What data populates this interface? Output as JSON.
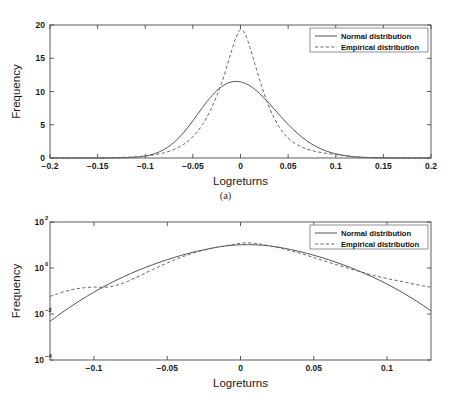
{
  "figure": {
    "caption_a": "(a)",
    "caption_b": "(b)"
  },
  "chart_data": [
    {
      "type": "line",
      "panel": "a",
      "title": "",
      "xlabel": "Logreturns",
      "ylabel": "Frequency",
      "xlim": [
        -0.2,
        0.2
      ],
      "ylim": [
        0,
        20
      ],
      "yscale": "linear",
      "xticks": [
        -0.2,
        -0.15,
        -0.1,
        -0.05,
        0,
        0.05,
        0.1,
        0.15,
        0.2
      ],
      "xticklabels": [
        "-0.2",
        "-0.15",
        "-0.1",
        "-0.05",
        "0",
        "0.05",
        "0.1",
        "0.15",
        "0.2"
      ],
      "yticks": [
        0,
        5,
        10,
        15,
        20
      ],
      "yticklabels": [
        "0",
        "5",
        "10",
        "15",
        "20"
      ],
      "grid": false,
      "legend_position": "upper right",
      "series": [
        {
          "name": "Normal distribution",
          "style": "solid",
          "color": "#555555",
          "x": [
            -0.2,
            -0.19,
            -0.18,
            -0.17,
            -0.16,
            -0.15,
            -0.14,
            -0.13,
            -0.12,
            -0.11,
            -0.1,
            -0.095,
            -0.09,
            -0.085,
            -0.08,
            -0.075,
            -0.07,
            -0.065,
            -0.06,
            -0.055,
            -0.05,
            -0.045,
            -0.04,
            -0.035,
            -0.03,
            -0.025,
            -0.02,
            -0.015,
            -0.01,
            -0.005,
            0,
            0.005,
            0.01,
            0.015,
            0.02,
            0.025,
            0.03,
            0.035,
            0.04,
            0.045,
            0.05,
            0.055,
            0.06,
            0.065,
            0.07,
            0.075,
            0.08,
            0.085,
            0.09,
            0.095,
            0.1,
            0.11,
            0.12,
            0.13,
            0.14,
            0.15,
            0.16,
            0.17,
            0.18,
            0.19,
            0.2
          ],
          "y": [
            0.0,
            0.0,
            0.0,
            0.0,
            0.0,
            0.0,
            0.01,
            0.02,
            0.05,
            0.13,
            0.3,
            0.45,
            0.66,
            0.94,
            1.3,
            1.76,
            2.32,
            3.0,
            3.78,
            4.65,
            5.6,
            6.58,
            7.57,
            8.51,
            9.37,
            10.11,
            10.71,
            11.15,
            11.42,
            11.52,
            11.45,
            11.22,
            10.84,
            10.33,
            9.71,
            9.0,
            8.23,
            7.43,
            6.62,
            5.82,
            5.06,
            4.34,
            3.68,
            3.08,
            2.55,
            2.08,
            1.68,
            1.34,
            1.05,
            0.82,
            0.63,
            0.35,
            0.18,
            0.09,
            0.04,
            0.02,
            0.01,
            0.0,
            0.0,
            0.0,
            0.0
          ]
        },
        {
          "name": "Empirical distribution",
          "style": "dashed",
          "color": "#666666",
          "x": [
            -0.2,
            -0.19,
            -0.18,
            -0.17,
            -0.16,
            -0.15,
            -0.14,
            -0.13,
            -0.12,
            -0.115,
            -0.11,
            -0.105,
            -0.1,
            -0.095,
            -0.09,
            -0.085,
            -0.08,
            -0.075,
            -0.07,
            -0.065,
            -0.06,
            -0.055,
            -0.05,
            -0.045,
            -0.04,
            -0.035,
            -0.03,
            -0.025,
            -0.02,
            -0.015,
            -0.01,
            -0.005,
            0,
            0.005,
            0.01,
            0.015,
            0.02,
            0.025,
            0.03,
            0.035,
            0.04,
            0.045,
            0.05,
            0.055,
            0.06,
            0.065,
            0.07,
            0.075,
            0.08,
            0.085,
            0.09,
            0.095,
            0.1,
            0.105,
            0.11,
            0.115,
            0.12,
            0.13,
            0.14,
            0.15,
            0.16,
            0.17,
            0.18,
            0.19,
            0.2
          ],
          "y": [
            0.0,
            0.0,
            0.0,
            0.0,
            0.01,
            0.02,
            0.04,
            0.07,
            0.11,
            0.14,
            0.18,
            0.23,
            0.3,
            0.38,
            0.49,
            0.62,
            0.79,
            1.0,
            1.27,
            1.6,
            2.02,
            2.55,
            3.2,
            4.0,
            5.0,
            6.2,
            7.65,
            9.3,
            11.2,
            13.4,
            15.8,
            18.0,
            19.3,
            18.6,
            16.6,
            14.2,
            11.8,
            9.6,
            7.7,
            6.1,
            4.8,
            3.8,
            3.0,
            2.4,
            1.95,
            1.6,
            1.32,
            1.12,
            0.95,
            0.82,
            0.7,
            0.6,
            0.5,
            0.41,
            0.33,
            0.25,
            0.18,
            0.09,
            0.04,
            0.02,
            0.01,
            0.0,
            0.0,
            0.0,
            0.0
          ]
        }
      ]
    },
    {
      "type": "line",
      "panel": "b",
      "title": "",
      "xlabel": "Logreturns",
      "ylabel": "Frequency",
      "xlim": [
        -0.13,
        0.13
      ],
      "ylim": [
        0.0001,
        100
      ],
      "yscale": "log",
      "xticks": [
        -0.1,
        -0.05,
        0,
        0.05,
        0.1
      ],
      "xticklabels": [
        "-0.1",
        "-0.05",
        "0",
        "0.05",
        "0.1"
      ],
      "yticks": [
        0.0001,
        0.01,
        1,
        100
      ],
      "yticklabels": [
        "10-4",
        "10-2",
        "100",
        "102"
      ],
      "ytick_mantissa": "10",
      "ytick_exponents": [
        "-4",
        "-2",
        "0",
        "2"
      ],
      "grid": false,
      "legend_position": "upper right",
      "series": [
        {
          "name": "Normal distribution",
          "style": "solid",
          "color": "#555555",
          "x": [
            -0.13,
            -0.125,
            -0.12,
            -0.115,
            -0.11,
            -0.105,
            -0.1,
            -0.095,
            -0.09,
            -0.085,
            -0.08,
            -0.075,
            -0.07,
            -0.065,
            -0.06,
            -0.055,
            -0.05,
            -0.045,
            -0.04,
            -0.035,
            -0.03,
            -0.025,
            -0.02,
            -0.015,
            -0.01,
            -0.005,
            0,
            0.005,
            0.01,
            0.015,
            0.02,
            0.025,
            0.03,
            0.035,
            0.04,
            0.045,
            0.05,
            0.055,
            0.06,
            0.065,
            0.07,
            0.075,
            0.08,
            0.085,
            0.09,
            0.095,
            0.1,
            0.105,
            0.11,
            0.115,
            0.12,
            0.125,
            0.13
          ],
          "y": [
            0.0048,
            0.0082,
            0.0138,
            0.0228,
            0.0368,
            0.058,
            0.0895,
            0.135,
            0.2,
            0.29,
            0.41,
            0.57,
            0.78,
            1.05,
            1.38,
            1.8,
            2.3,
            2.9,
            3.6,
            4.4,
            5.3,
            6.2,
            7.2,
            8.2,
            9.1,
            9.8,
            10.2,
            10.4,
            10.2,
            9.8,
            9.1,
            8.2,
            7.2,
            6.2,
            5.3,
            4.4,
            3.6,
            2.9,
            2.3,
            1.8,
            1.38,
            1.05,
            0.78,
            0.57,
            0.41,
            0.29,
            0.2,
            0.135,
            0.0895,
            0.058,
            0.0368,
            0.0228,
            0.0138
          ]
        },
        {
          "name": "Empirical distribution",
          "style": "dashed",
          "color": "#666666",
          "x": [
            -0.13,
            -0.125,
            -0.12,
            -0.115,
            -0.11,
            -0.105,
            -0.1,
            -0.095,
            -0.09,
            -0.085,
            -0.08,
            -0.075,
            -0.07,
            -0.065,
            -0.06,
            -0.055,
            -0.05,
            -0.045,
            -0.04,
            -0.035,
            -0.03,
            -0.025,
            -0.02,
            -0.015,
            -0.01,
            -0.005,
            0,
            0.005,
            0.01,
            0.015,
            0.02,
            0.025,
            0.03,
            0.035,
            0.04,
            0.045,
            0.05,
            0.055,
            0.06,
            0.065,
            0.07,
            0.075,
            0.08,
            0.085,
            0.09,
            0.095,
            0.1,
            0.105,
            0.11,
            0.115,
            0.12,
            0.125,
            0.13
          ],
          "y": [
            0.058,
            0.075,
            0.095,
            0.115,
            0.13,
            0.142,
            0.148,
            0.145,
            0.15,
            0.175,
            0.22,
            0.3,
            0.42,
            0.6,
            0.85,
            1.2,
            1.65,
            2.25,
            3.0,
            3.9,
            4.9,
            6.0,
            7.1,
            8.2,
            9.3,
            10.5,
            11.8,
            12.4,
            11.8,
            10.6,
            9.2,
            7.8,
            6.6,
            5.5,
            4.5,
            3.6,
            2.85,
            2.25,
            1.78,
            1.42,
            1.15,
            0.92,
            0.74,
            0.6,
            0.49,
            0.41,
            0.35,
            0.3,
            0.26,
            0.22,
            0.19,
            0.165,
            0.145
          ]
        }
      ]
    }
  ]
}
